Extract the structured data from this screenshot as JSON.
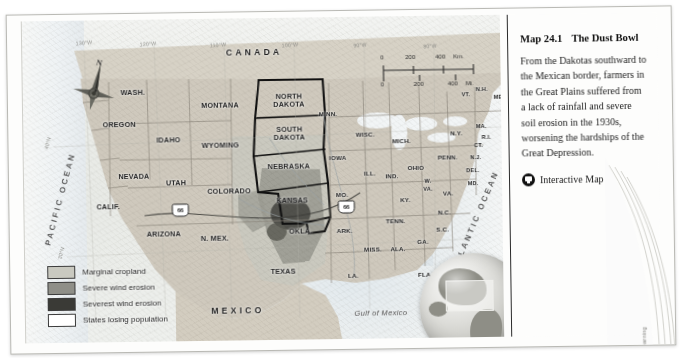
{
  "figure": {
    "title_number": "Map 24.1",
    "title_text": "The Dust Bowl",
    "caption": "From the Dakotas southward to the Mexican border, farmers in the Great Plains suffered from a lack of rainfall and severe soil erosion in the 1930s, worsening the hardships of the Great Depression.",
    "interactive_label": "Interactive Map",
    "interactive_icon": "monitor-icon",
    "copyright": "Copyright © Cengage Learning"
  },
  "legend": {
    "items": [
      {
        "label": "Marginal cropland",
        "color": "#c9c9c0"
      },
      {
        "label": "Severe wind erosion",
        "color": "#8f8f88"
      },
      {
        "label": "Severest wind erosion",
        "color": "#3a3a36"
      },
      {
        "label": "States losing population",
        "color": "#ffffff"
      }
    ]
  },
  "scale": {
    "km_ticks": [
      "0",
      "200",
      "400"
    ],
    "km_unit": "Km.",
    "mi_ticks": [
      "0",
      "200",
      "400"
    ],
    "mi_unit": "Mi."
  },
  "compass": {
    "north_label": "N"
  },
  "graticule": {
    "labels": [
      {
        "text": "130°W",
        "x": 62,
        "y": 22
      },
      {
        "text": "120°W",
        "x": 126,
        "y": 24
      },
      {
        "text": "110°W",
        "x": 196,
        "y": 26
      },
      {
        "text": "100°W",
        "x": 268,
        "y": 27
      },
      {
        "text": "90°W",
        "x": 338,
        "y": 28
      },
      {
        "text": "80°W",
        "x": 408,
        "y": 30
      },
      {
        "text": "40°N",
        "x": 24,
        "y": 122
      },
      {
        "text": "30°N",
        "x": 36,
        "y": 232
      }
    ]
  },
  "map": {
    "countries": [
      {
        "name": "CANADA",
        "x": 232,
        "y": 34
      },
      {
        "name": "MEXICO",
        "x": 212,
        "y": 292
      }
    ],
    "oceans": [
      {
        "name": "PACIFIC OCEAN",
        "x": 36,
        "y": 178,
        "rotate": -74
      },
      {
        "name": "ATLANTIC OCEAN",
        "x": 451,
        "y": 205,
        "rotate": -66
      }
    ],
    "water_bodies": [
      {
        "name": "Gulf of Mexico",
        "x": 355,
        "y": 296
      }
    ],
    "route_shields": [
      {
        "label": "66",
        "x": 156,
        "y": 191
      },
      {
        "label": "66",
        "x": 322,
        "y": 190
      }
    ],
    "states": [
      {
        "name": "WASH.",
        "x": 110,
        "y": 72,
        "size": "st"
      },
      {
        "name": "OREGON",
        "x": 96,
        "y": 104,
        "size": "st"
      },
      {
        "name": "IDAHO",
        "x": 145,
        "y": 120,
        "size": "st"
      },
      {
        "name": "MONTANA",
        "x": 197,
        "y": 86,
        "size": "st"
      },
      {
        "name": "WYOMING",
        "x": 197,
        "y": 126,
        "size": "st"
      },
      {
        "name": "NEVADA",
        "x": 110,
        "y": 156,
        "size": "st"
      },
      {
        "name": "UTAH",
        "x": 152,
        "y": 163,
        "size": "st"
      },
      {
        "name": "CALIF.",
        "x": 84,
        "y": 186,
        "size": "st"
      },
      {
        "name": "COLORADO",
        "x": 205,
        "y": 172,
        "size": "st"
      },
      {
        "name": "ARIZONA",
        "x": 139,
        "y": 214,
        "size": "st"
      },
      {
        "name": "N. MEX.",
        "x": 190,
        "y": 219,
        "size": "st"
      },
      {
        "name": "NORTH DAKOTA",
        "x": 266,
        "y": 83,
        "size": "st",
        "stack": true
      },
      {
        "name": "SOUTH DAKOTA",
        "x": 266,
        "y": 116,
        "size": "st",
        "stack": true
      },
      {
        "name": "NEBRASKA",
        "x": 265,
        "y": 148,
        "size": "st"
      },
      {
        "name": "KANSAS",
        "x": 268,
        "y": 182,
        "size": "st"
      },
      {
        "name": "OKLA.",
        "x": 276,
        "y": 213,
        "size": "st"
      },
      {
        "name": "TEXAS",
        "x": 258,
        "y": 253,
        "size": "st"
      },
      {
        "name": "MINN.",
        "x": 305,
        "y": 96,
        "size": "sm"
      },
      {
        "name": "IOWA",
        "x": 314,
        "y": 140,
        "size": "sm"
      },
      {
        "name": "MO.",
        "x": 318,
        "y": 177,
        "size": "sm"
      },
      {
        "name": "ARK.",
        "x": 320,
        "y": 213,
        "size": "sm"
      },
      {
        "name": "LA.",
        "x": 328,
        "y": 258,
        "size": "sm"
      },
      {
        "name": "WISC.",
        "x": 342,
        "y": 117,
        "size": "sm"
      },
      {
        "name": "ILL.",
        "x": 346,
        "y": 156,
        "size": "sm"
      },
      {
        "name": "MICH.",
        "x": 378,
        "y": 124,
        "size": "sm"
      },
      {
        "name": "IND.",
        "x": 368,
        "y": 159,
        "size": "sm"
      },
      {
        "name": "OHIO",
        "x": 392,
        "y": 151,
        "size": "sm"
      },
      {
        "name": "KY.",
        "x": 381,
        "y": 183,
        "size": "sm"
      },
      {
        "name": "TENN.",
        "x": 371,
        "y": 204,
        "size": "sm"
      },
      {
        "name": "MISS.",
        "x": 348,
        "y": 232,
        "size": "sm"
      },
      {
        "name": "ALA.",
        "x": 373,
        "y": 232,
        "size": "sm"
      },
      {
        "name": "GA.",
        "x": 398,
        "y": 225,
        "size": "sm"
      },
      {
        "name": "FLA.",
        "x": 400,
        "y": 258,
        "size": "sm"
      },
      {
        "name": "S.C.",
        "x": 418,
        "y": 213,
        "size": "sm"
      },
      {
        "name": "N.C.",
        "x": 420,
        "y": 196,
        "size": "sm"
      },
      {
        "name": "VA.",
        "x": 424,
        "y": 177,
        "size": "sm"
      },
      {
        "name": "W. VA.",
        "x": 404,
        "y": 170,
        "size": "xs",
        "stack": true
      },
      {
        "name": "PENN.",
        "x": 424,
        "y": 141,
        "size": "sm"
      },
      {
        "name": "N.Y.",
        "x": 433,
        "y": 117,
        "size": "sm"
      },
      {
        "name": "MD.",
        "x": 449,
        "y": 168,
        "size": "xs"
      },
      {
        "name": "DEL.",
        "x": 449,
        "y": 155,
        "size": "xs"
      },
      {
        "name": "N.J.",
        "x": 452,
        "y": 142,
        "size": "xs"
      },
      {
        "name": "CT.",
        "x": 455,
        "y": 130,
        "size": "xs"
      },
      {
        "name": "R.I.",
        "x": 463,
        "y": 122,
        "size": "xs"
      },
      {
        "name": "MA.",
        "x": 458,
        "y": 111,
        "size": "xs"
      },
      {
        "name": "VT.",
        "x": 443,
        "y": 79,
        "size": "xs"
      },
      {
        "name": "N.H.",
        "x": 459,
        "y": 74,
        "size": "xs"
      },
      {
        "name": "ME.",
        "x": 476,
        "y": 82,
        "size": "xs"
      }
    ]
  }
}
